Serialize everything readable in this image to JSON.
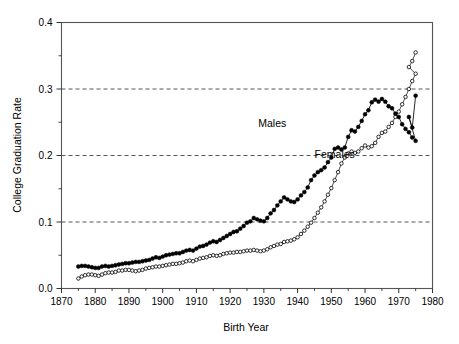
{
  "chart_data": {
    "type": "line",
    "title": "",
    "xlabel": "Birth Year",
    "ylabel": "College Graduation Rate",
    "xlim": [
      1870,
      1980
    ],
    "ylim": [
      0.0,
      0.4
    ],
    "xticks": [
      1870,
      1880,
      1890,
      1900,
      1910,
      1920,
      1930,
      1940,
      1950,
      1960,
      1970,
      1980
    ],
    "xtick_labels": [
      "1870",
      "1880",
      "1890",
      "1900",
      "1910",
      "1920",
      "1930",
      "1940",
      "1950",
      "1960",
      "1970",
      "1980"
    ],
    "xminor_ticks": [
      1875,
      1885,
      1895,
      1905,
      1915,
      1925,
      1935,
      1945,
      1955,
      1965,
      1975
    ],
    "yticks": [
      0.0,
      0.1,
      0.2,
      0.3,
      0.4
    ],
    "ytick_labels": [
      "0.0",
      "0.1",
      "0.2",
      "0.3",
      "0.4"
    ],
    "yminor_ticks": [
      0.05,
      0.15,
      0.25,
      0.35
    ],
    "gridlines_y": [
      0.1,
      0.2,
      0.3
    ],
    "grid": "horizontal-dashed",
    "legend_position": "inline-annotations",
    "annotations": [
      {
        "text": "Males",
        "x": 1932.5,
        "y": 0.243
      },
      {
        "text": "Females",
        "x": 1951.0,
        "y": 0.196
      }
    ],
    "series": [
      {
        "name": "Males",
        "marker": "filled-circle",
        "color": "#000000",
        "x": [
          1875,
          1876,
          1877,
          1878,
          1879,
          1880,
          1881,
          1882,
          1883,
          1884,
          1885,
          1886,
          1887,
          1888,
          1889,
          1890,
          1891,
          1892,
          1893,
          1894,
          1895,
          1896,
          1897,
          1898,
          1899,
          1900,
          1901,
          1902,
          1903,
          1904,
          1905,
          1906,
          1907,
          1908,
          1909,
          1910,
          1911,
          1912,
          1913,
          1914,
          1915,
          1916,
          1917,
          1918,
          1919,
          1920,
          1921,
          1922,
          1923,
          1924,
          1925,
          1926,
          1927,
          1928,
          1929,
          1930,
          1931,
          1932,
          1933,
          1934,
          1935,
          1936,
          1937,
          1938,
          1939,
          1940,
          1941,
          1942,
          1943,
          1944,
          1945,
          1946,
          1947,
          1948,
          1949,
          1950,
          1951,
          1952,
          1953,
          1954,
          1955,
          1956,
          1957,
          1958,
          1959,
          1960,
          1961,
          1962,
          1963,
          1964,
          1965,
          1966,
          1967,
          1968,
          1969,
          1970,
          1971,
          1972,
          1973,
          1974,
          1975
        ],
        "values": [
          0.033,
          0.034,
          0.034,
          0.033,
          0.032,
          0.031,
          0.031,
          0.033,
          0.034,
          0.033,
          0.034,
          0.035,
          0.036,
          0.037,
          0.038,
          0.038,
          0.039,
          0.04,
          0.04,
          0.041,
          0.042,
          0.043,
          0.045,
          0.047,
          0.046,
          0.048,
          0.05,
          0.051,
          0.052,
          0.053,
          0.053,
          0.055,
          0.057,
          0.058,
          0.057,
          0.06,
          0.063,
          0.064,
          0.066,
          0.069,
          0.071,
          0.07,
          0.073,
          0.076,
          0.079,
          0.082,
          0.085,
          0.086,
          0.09,
          0.094,
          0.099,
          0.101,
          0.106,
          0.104,
          0.102,
          0.101,
          0.106,
          0.113,
          0.118,
          0.125,
          0.131,
          0.137,
          0.134,
          0.131,
          0.13,
          0.134,
          0.14,
          0.145,
          0.152,
          0.163,
          0.17,
          0.175,
          0.178,
          0.182,
          0.19,
          0.197,
          0.21,
          0.212,
          0.209,
          0.212,
          0.228,
          0.238,
          0.236,
          0.243,
          0.252,
          0.262,
          0.268,
          0.28,
          0.284,
          0.281,
          0.285,
          0.281,
          0.274,
          0.271,
          0.263,
          0.258,
          0.247,
          0.24,
          0.235,
          0.227,
          0.222
        ],
        "x2": [
          1976,
          1977,
          1978,
          1979,
          1980,
          1981
        ],
        "values2": []
      },
      {
        "name": "Females",
        "marker": "open-circle",
        "color": "#000000",
        "x": [
          1875,
          1876,
          1877,
          1878,
          1879,
          1880,
          1881,
          1882,
          1883,
          1884,
          1885,
          1886,
          1887,
          1888,
          1889,
          1890,
          1891,
          1892,
          1893,
          1894,
          1895,
          1896,
          1897,
          1898,
          1899,
          1900,
          1901,
          1902,
          1903,
          1904,
          1905,
          1906,
          1907,
          1908,
          1909,
          1910,
          1911,
          1912,
          1913,
          1914,
          1915,
          1916,
          1917,
          1918,
          1919,
          1920,
          1921,
          1922,
          1923,
          1924,
          1925,
          1926,
          1927,
          1928,
          1929,
          1930,
          1931,
          1932,
          1933,
          1934,
          1935,
          1936,
          1937,
          1938,
          1939,
          1940,
          1941,
          1942,
          1943,
          1944,
          1945,
          1946,
          1947,
          1948,
          1949,
          1950,
          1951,
          1952,
          1953,
          1954,
          1955,
          1956,
          1957,
          1958,
          1959,
          1960,
          1961,
          1962,
          1963,
          1964,
          1965,
          1966,
          1967,
          1968,
          1969,
          1970,
          1971,
          1972,
          1973,
          1974,
          1975
        ],
        "values": [
          0.015,
          0.018,
          0.02,
          0.021,
          0.021,
          0.02,
          0.019,
          0.021,
          0.023,
          0.024,
          0.024,
          0.025,
          0.027,
          0.027,
          0.028,
          0.028,
          0.027,
          0.026,
          0.027,
          0.028,
          0.03,
          0.031,
          0.032,
          0.033,
          0.033,
          0.034,
          0.035,
          0.036,
          0.037,
          0.037,
          0.038,
          0.039,
          0.041,
          0.042,
          0.041,
          0.043,
          0.045,
          0.046,
          0.047,
          0.049,
          0.05,
          0.049,
          0.05,
          0.052,
          0.053,
          0.054,
          0.054,
          0.055,
          0.055,
          0.056,
          0.057,
          0.057,
          0.058,
          0.057,
          0.056,
          0.057,
          0.059,
          0.062,
          0.064,
          0.066,
          0.067,
          0.07,
          0.071,
          0.072,
          0.074,
          0.077,
          0.082,
          0.087,
          0.093,
          0.099,
          0.106,
          0.114,
          0.122,
          0.131,
          0.141,
          0.151,
          0.163,
          0.175,
          0.188,
          0.197,
          0.203,
          0.206,
          0.204,
          0.206,
          0.211,
          0.215,
          0.212,
          0.214,
          0.219,
          0.228,
          0.234,
          0.236,
          0.243,
          0.249,
          0.258,
          0.266,
          0.277,
          0.288,
          0.3,
          0.312,
          0.323
        ]
      }
    ]
  },
  "males_tail": {
    "x": [
      1973,
      1974,
      1975
    ],
    "values": [
      0.258,
      0.242,
      0.29
    ]
  },
  "females_tail": {
    "x": [
      1973,
      1974,
      1975
    ],
    "values": [
      0.333,
      0.342,
      0.355
    ]
  }
}
